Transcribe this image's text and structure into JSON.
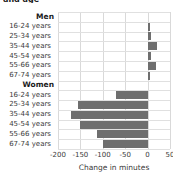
{
  "title": "and age",
  "axis_title": "Change in minutes",
  "group_men": "Men",
  "group_women": "Women",
  "xticks": [
    "-200",
    "-150",
    "-100",
    "-50",
    "0",
    "50"
  ],
  "colors": {
    "bar": "#6e6e6e",
    "grid": "#d9d9d9",
    "text": "#3a3a3a"
  },
  "chart_data": {
    "type": "bar",
    "orientation": "horizontal",
    "title": "and age",
    "xlabel": "Change in minutes",
    "ylabel": "",
    "xlim": [
      -200,
      50
    ],
    "xticks": [
      -200,
      -150,
      -100,
      -50,
      0,
      50
    ],
    "grid": true,
    "legend": "none",
    "groups": [
      {
        "name": "Men",
        "categories": [
          "16-24 years",
          "25-34 years",
          "35-44 years",
          "45-54 years",
          "55-66 years",
          "67-74 years"
        ],
        "values": [
          5,
          7,
          20,
          8,
          19,
          5
        ]
      },
      {
        "name": "Women",
        "categories": [
          "16-24 years",
          "25-34 years",
          "35-44 years",
          "45-54 years",
          "55-66 years",
          "67-74 years"
        ],
        "values": [
          -70,
          -155,
          -172,
          -152,
          -113,
          -100
        ]
      }
    ]
  }
}
